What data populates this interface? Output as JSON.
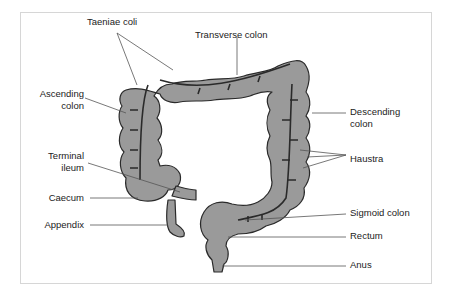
{
  "diagram": {
    "colors": {
      "fill": "#9a9a9a",
      "outline": "#2a2a2a",
      "leader": "#555555",
      "text": "#222222",
      "frame": "#d6d6d6"
    },
    "labels": {
      "taeniae_coli": "Taeniae coli",
      "transverse_colon": "Transverse colon",
      "ascending_colon_1": "Ascending",
      "ascending_colon_2": "colon",
      "descending_colon_1": "Descending",
      "descending_colon_2": "colon",
      "terminal_ileum_1": "Terminal",
      "terminal_ileum_2": "ileum",
      "haustra": "Haustra",
      "caecum": "Caecum",
      "appendix": "Appendix",
      "sigmoid_colon": "Sigmoid colon",
      "rectum": "Rectum",
      "anus": "Anus"
    }
  }
}
